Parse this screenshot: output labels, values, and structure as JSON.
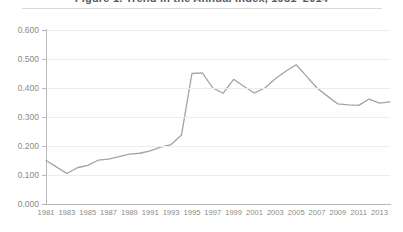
{
  "title": {
    "text": "Figure 1. Trend in the Annual Index, 1981–2014",
    "note": "cropped at top edge of screenshot",
    "rule_color": "#d8d8d8"
  },
  "axes": {
    "y_ticks": [
      "0.000",
      "0.100",
      "0.200",
      "0.300",
      "0.400",
      "0.500",
      "0.600"
    ],
    "x_ticks": [
      "1981",
      "1983",
      "1985",
      "1987",
      "1989",
      "1991",
      "1993",
      "1995",
      "1997",
      "1999",
      "2001",
      "2003",
      "2005",
      "2007",
      "2009",
      "2011",
      "2013"
    ],
    "line_color": "#b9b9b9",
    "label_color": "#8a8a8a",
    "grid_color": "#ececec"
  },
  "chart_data": {
    "type": "line",
    "title": "Figure 1. Trend in the Annual Index, 1981–2014",
    "xlabel": "",
    "ylabel": "",
    "xlim": [
      1981,
      2014
    ],
    "ylim": [
      0.0,
      0.6
    ],
    "ytick_step": 0.1,
    "grid": true,
    "legend": false,
    "series_color": "#a3a3a3",
    "markers": false,
    "x": [
      1981,
      1982,
      1983,
      1984,
      1985,
      1986,
      1987,
      1988,
      1989,
      1990,
      1991,
      1992,
      1993,
      1994,
      1995,
      1996,
      1997,
      1998,
      1999,
      2000,
      2001,
      2002,
      2003,
      2004,
      2005,
      2006,
      2007,
      2008,
      2009,
      2010,
      2011,
      2012,
      2013,
      2014
    ],
    "series": [
      {
        "name": "Index",
        "values": [
          0.15,
          0.128,
          0.105,
          0.125,
          0.133,
          0.151,
          0.155,
          0.163,
          0.172,
          0.175,
          0.183,
          0.196,
          0.205,
          0.238,
          0.45,
          0.452,
          0.4,
          0.382,
          0.43,
          0.405,
          0.383,
          0.4,
          0.432,
          0.458,
          0.48,
          0.44,
          0.4,
          0.372,
          0.345,
          0.342,
          0.34,
          0.362,
          0.348,
          0.352
        ]
      }
    ]
  }
}
